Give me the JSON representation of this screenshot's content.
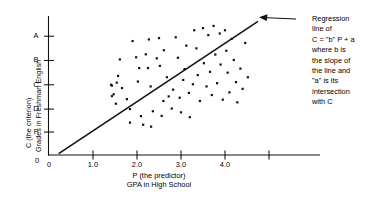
{
  "chart_data": {
    "type": "scatter",
    "title": "",
    "xlabel": "P (the predictor) GPA in High School",
    "xlabel_lines": [
      "P (the predictor)",
      "GPA in High School"
    ],
    "ylabel": "C (the criterion) Grades in Freshman English",
    "ylabel_lines": [
      "C (the criterion)",
      "Grades in Freshman English"
    ],
    "x_ticks": [
      {
        "value": 0,
        "label": "0"
      },
      {
        "value": 1.0,
        "label": "1.0"
      },
      {
        "value": 2.0,
        "label": "2.0"
      },
      {
        "value": 3.0,
        "label": "3.0"
      },
      {
        "value": 4.0,
        "label": "4.0"
      },
      {
        "value": 5.0,
        "label": ""
      }
    ],
    "y_ticks": [
      {
        "value": 4.4,
        "label": "A"
      },
      {
        "value": 3.5,
        "label": "B"
      },
      {
        "value": 2.6,
        "label": "C"
      },
      {
        "value": 1.7,
        "label": "D"
      },
      {
        "value": 0.85,
        "label": "F"
      },
      {
        "value": 0,
        "label": "0"
      }
    ],
    "xlim": [
      0,
      6.16
    ],
    "ylim": [
      0,
      5.0
    ],
    "grid": false,
    "legend": null,
    "points": [
      [
        1.41,
        2.6
      ],
      [
        1.43,
        2.57
      ],
      [
        1.47,
        2.25
      ],
      [
        1.43,
        2.18
      ],
      [
        1.52,
        1.9
      ],
      [
        1.54,
        2.68
      ],
      [
        1.61,
        3.54
      ],
      [
        1.57,
        2.93
      ],
      [
        1.66,
        2.48
      ],
      [
        1.77,
        2.07
      ],
      [
        1.84,
        1.7
      ],
      [
        1.84,
        1.2
      ],
      [
        1.9,
        4.22
      ],
      [
        1.98,
        3.62
      ],
      [
        2.05,
        3.22
      ],
      [
        2.02,
        2.72
      ],
      [
        2.09,
        1.44
      ],
      [
        2.14,
        1.12
      ],
      [
        2.2,
        3.73
      ],
      [
        2.27,
        4.28
      ],
      [
        2.25,
        3.22
      ],
      [
        2.31,
        2.54
      ],
      [
        2.36,
        1.62
      ],
      [
        2.32,
        1.05
      ],
      [
        2.45,
        3.58
      ],
      [
        2.5,
        4.33
      ],
      [
        2.52,
        3.3
      ],
      [
        2.56,
        1.45
      ],
      [
        2.6,
        2.0
      ],
      [
        2.61,
        3.88
      ],
      [
        2.68,
        2.88
      ],
      [
        2.72,
        2.17
      ],
      [
        2.79,
        1.72
      ],
      [
        2.82,
        2.42
      ],
      [
        2.88,
        4.36
      ],
      [
        2.93,
        3.6
      ],
      [
        2.97,
        2.12
      ],
      [
        3.0,
        1.58
      ],
      [
        3.05,
        2.78
      ],
      [
        3.08,
        3.18
      ],
      [
        3.12,
        4.05
      ],
      [
        3.18,
        2.3
      ],
      [
        3.2,
        1.4
      ],
      [
        3.27,
        2.62
      ],
      [
        3.3,
        4.62
      ],
      [
        3.35,
        3.95
      ],
      [
        3.38,
        2.96
      ],
      [
        3.43,
        2.0
      ],
      [
        3.5,
        4.7
      ],
      [
        3.52,
        3.4
      ],
      [
        3.58,
        2.54
      ],
      [
        3.62,
        4.44
      ],
      [
        3.66,
        3.08
      ],
      [
        3.7,
        2.22
      ],
      [
        3.74,
        4.78
      ],
      [
        3.78,
        3.72
      ],
      [
        3.82,
        2.66
      ],
      [
        3.88,
        4.5
      ],
      [
        3.9,
        3.35
      ],
      [
        3.95,
        2.05
      ],
      [
        4.0,
        4.62
      ],
      [
        4.03,
        3.86
      ],
      [
        4.06,
        3.05
      ],
      [
        4.1,
        2.32
      ],
      [
        4.15,
        4.3
      ],
      [
        4.2,
        3.52
      ],
      [
        4.25,
        2.7
      ],
      [
        4.28,
        1.95
      ],
      [
        4.35,
        3.2
      ],
      [
        4.4,
        2.45
      ],
      [
        4.46,
        4.15
      ],
      [
        4.52,
        2.88
      ]
    ],
    "regression_line": {
      "label": "Regression line",
      "x_start": 0.22,
      "y_start": 0.05,
      "x_end": 4.75,
      "y_end": 4.95
    }
  },
  "annotation": {
    "lines": [
      "Regression",
      "line of",
      "C = \"b\" P + a",
      "where b is",
      "the slope of",
      "the line and",
      "\"a\" is its",
      "intersection",
      "with C"
    ]
  }
}
